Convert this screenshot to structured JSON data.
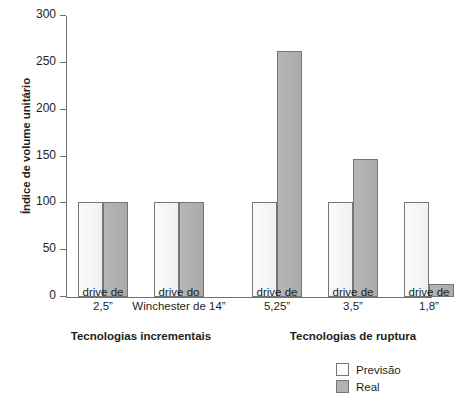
{
  "chart_data": {
    "type": "bar",
    "title": "",
    "xlabel": "",
    "ylabel": "Índice de volume unitário",
    "ylim": [
      0,
      300
    ],
    "yticks": [
      0,
      50,
      100,
      150,
      200,
      250,
      300
    ],
    "ytick_labels": [
      "0",
      "50",
      "100",
      "150",
      "200",
      "250",
      "300"
    ],
    "grid": false,
    "legend_position": "bottom-right",
    "categories": [
      "drive de 2,5”",
      "drive do Winchester de 14”",
      "drive de 5,25”",
      "drive de 3,5”",
      "drive de 1,8”"
    ],
    "series": [
      {
        "name": "Previsão",
        "color": "#f5f5f5",
        "values": [
          101,
          101,
          101,
          101,
          101
        ]
      },
      {
        "name": "Real",
        "color": "#b2b2b2",
        "values": [
          101,
          101,
          263,
          147,
          14
        ]
      }
    ],
    "groups": [
      {
        "label": "Tecnologias incrementais",
        "categories": [
          "drive de 2,5”",
          "drive do Winchester de 14”"
        ]
      },
      {
        "label": "Tecnologias de ruptura",
        "categories": [
          "drive de 5,25”",
          "drive de 3,5”",
          "drive de 1,8”"
        ]
      }
    ]
  },
  "axis": {
    "y_title": "Índice de volume unitário",
    "ticks": [
      {
        "value": 300,
        "label": "300"
      },
      {
        "value": 250,
        "label": "250"
      },
      {
        "value": 200,
        "label": "200"
      },
      {
        "value": 150,
        "label": "150"
      },
      {
        "value": 100,
        "label": "100"
      },
      {
        "value": 50,
        "label": "50"
      },
      {
        "value": 0,
        "label": "0"
      }
    ]
  },
  "categories": [
    {
      "line1": "drive de",
      "line2": "2,5”"
    },
    {
      "line1": "drive do",
      "line2": "Winchester de 14”"
    },
    {
      "line1": "drive de",
      "line2": "5,25”"
    },
    {
      "line1": "drive de",
      "line2": "3,5”"
    },
    {
      "line1": "drive de",
      "line2": "1,8”"
    }
  ],
  "group_labels": [
    "Tecnologias incrementais",
    "Tecnologias de ruptura"
  ],
  "legend": {
    "items": [
      {
        "label": "Previsão",
        "swatch": "previsao-swatch"
      },
      {
        "label": "Real",
        "swatch": "real-swatch"
      }
    ]
  },
  "caption": {
    "sliver_text": ""
  }
}
